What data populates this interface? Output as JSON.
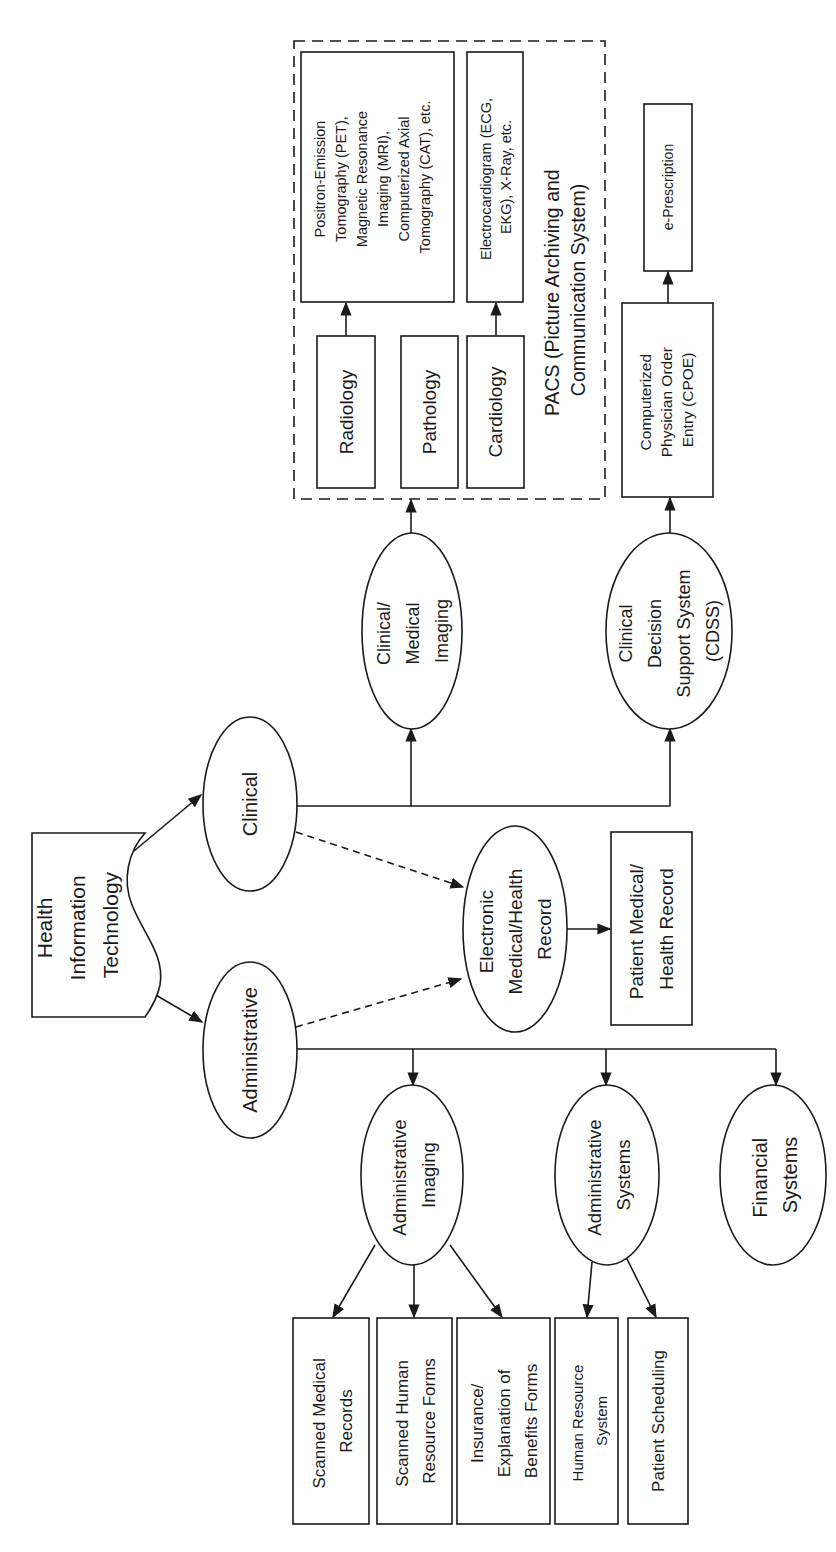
{
  "diagram": {
    "orientation": "rotated 90 degrees counter-clockwise",
    "root": {
      "label": [
        "Health",
        "Information",
        "Technology"
      ],
      "shape": "document"
    },
    "branches": {
      "clinical": {
        "label": [
          "Clinical"
        ],
        "shape": "ellipse"
      },
      "administrative": {
        "label": [
          "Administrative"
        ],
        "shape": "ellipse"
      }
    },
    "clinical_children": {
      "medical_imaging": {
        "label": [
          "Clinical/",
          "Medical",
          "Imaging"
        ],
        "shape": "ellipse"
      },
      "cdss": {
        "label": [
          "Clinical",
          "Decision",
          "Support System",
          "(CDSS)"
        ],
        "shape": "ellipse"
      }
    },
    "ehr": {
      "label": [
        "Electronic",
        "Medical/Health",
        "Record"
      ],
      "shape": "ellipse"
    },
    "patient_record": {
      "label": [
        "Patient Medical/",
        "Health Record"
      ],
      "shape": "rectangle"
    },
    "pacs": {
      "label": [
        "PACS (Picture Archiving and",
        "Communication System)"
      ],
      "shape": "dashed-group",
      "departments": [
        {
          "label": [
            "Radiology"
          ]
        },
        {
          "label": [
            "Pathology"
          ]
        },
        {
          "label": [
            "Cardiology"
          ]
        }
      ],
      "modalities": [
        {
          "label": [
            "Positron-Emission",
            "Tomography  (PET),",
            "Magnetic Resonance",
            "Imaging (MRI),",
            "Computerized Axial",
            "Tomography (CAT), etc."
          ]
        },
        {
          "label": [
            "Electrocardiogram (ECG,",
            "EKG), X-Ray, etc."
          ]
        }
      ]
    },
    "cpoe": {
      "label": [
        "Computerized",
        "Physician Order",
        "Entry (CPOE)"
      ],
      "shape": "rectangle"
    },
    "eprescription": {
      "label": [
        "e-Prescription"
      ],
      "shape": "rectangle"
    },
    "administrative_children": {
      "admin_imaging": {
        "label": [
          "Administrative",
          "Imaging"
        ],
        "shape": "ellipse"
      },
      "admin_systems": {
        "label": [
          "Administrative",
          "Systems"
        ],
        "shape": "ellipse"
      },
      "financial_systems": {
        "label": [
          "Financial",
          "Systems"
        ],
        "shape": "ellipse"
      }
    },
    "admin_imaging_outputs": [
      {
        "label": [
          "Scanned Medical",
          "Records"
        ]
      },
      {
        "label": [
          "Scanned Human",
          "Resource Forms"
        ]
      },
      {
        "label": [
          "Insurance/",
          "Explanation of",
          "Benefits Forms"
        ]
      }
    ],
    "admin_systems_outputs": [
      {
        "label": [
          "Human Resource",
          "System"
        ]
      },
      {
        "label": [
          "Patient Scheduling"
        ]
      }
    ],
    "edges": [
      {
        "from": "Health Information Technology",
        "to": "Clinical",
        "style": "solid"
      },
      {
        "from": "Health Information Technology",
        "to": "Administrative",
        "style": "solid"
      },
      {
        "from": "Clinical",
        "to": "Electronic Medical/Health Record",
        "style": "dashed"
      },
      {
        "from": "Administrative",
        "to": "Electronic Medical/Health Record",
        "style": "dashed"
      },
      {
        "from": "Electronic Medical/Health Record",
        "to": "Patient Medical/Health Record",
        "style": "solid"
      },
      {
        "from": "Clinical",
        "to": "Clinical/Medical Imaging",
        "style": "solid"
      },
      {
        "from": "Clinical",
        "to": "Clinical Decision Support System (CDSS)",
        "style": "solid"
      },
      {
        "from": "Clinical/Medical Imaging",
        "to": "PACS",
        "style": "solid"
      },
      {
        "from": "Radiology",
        "to": "PET/MRI/CAT",
        "style": "solid"
      },
      {
        "from": "Cardiology",
        "to": "ECG/EKG/X-Ray",
        "style": "solid"
      },
      {
        "from": "Clinical Decision Support System (CDSS)",
        "to": "Computerized Physician Order Entry (CPOE)",
        "style": "solid"
      },
      {
        "from": "Computerized Physician Order Entry (CPOE)",
        "to": "e-Prescription",
        "style": "solid"
      },
      {
        "from": "Administrative",
        "to": "Administrative Imaging",
        "style": "solid"
      },
      {
        "from": "Administrative",
        "to": "Administrative Systems",
        "style": "solid"
      },
      {
        "from": "Administrative",
        "to": "Financial Systems",
        "style": "solid"
      },
      {
        "from": "Administrative Imaging",
        "to": "Scanned Medical Records",
        "style": "solid"
      },
      {
        "from": "Administrative Imaging",
        "to": "Scanned Human Resource Forms",
        "style": "solid"
      },
      {
        "from": "Administrative Imaging",
        "to": "Insurance/Explanation of Benefits Forms",
        "style": "solid"
      },
      {
        "from": "Administrative Systems",
        "to": "Human Resource System",
        "style": "solid"
      },
      {
        "from": "Administrative Systems",
        "to": "Patient Scheduling",
        "style": "solid"
      }
    ]
  }
}
